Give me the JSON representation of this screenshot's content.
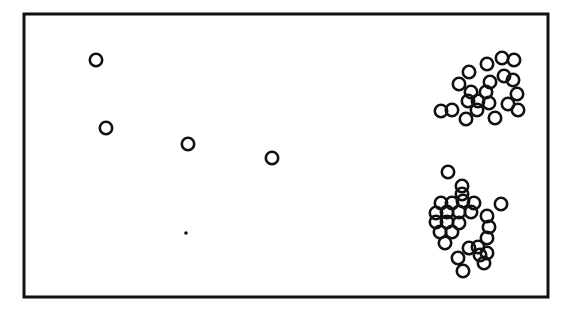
{
  "figure": {
    "width": 563,
    "height": 311,
    "background": "#ffffff",
    "frame": {
      "x": 24,
      "y": 14,
      "width": 524,
      "height": 283,
      "stroke": "#111111",
      "stroke_width": 3,
      "fill": "#ffffff"
    }
  },
  "chart_data": {
    "type": "scatter",
    "title": "",
    "subtitle": "",
    "xlabel": "",
    "ylabel": "",
    "xticklabels": [],
    "yticklabels": [],
    "xlim": [
      24,
      548
    ],
    "ylim": [
      14,
      297
    ],
    "grid": false,
    "legend": null,
    "axes_visible": false,
    "frame_visible": true,
    "marker": {
      "shape": "open-circle",
      "radius": 6.2,
      "stroke": "#111111",
      "stroke_width": 2.6,
      "fill": "none"
    },
    "marker_small": {
      "shape": "filled-dot",
      "radius": 1.8,
      "fill": "#111111"
    },
    "groups": [
      {
        "name": "sparse-left-points",
        "count": 4,
        "points": [
          {
            "x": 96,
            "y": 60
          },
          {
            "x": 106,
            "y": 128
          },
          {
            "x": 188,
            "y": 144
          },
          {
            "x": 272,
            "y": 158
          }
        ]
      },
      {
        "name": "tiny-speck",
        "count": 1,
        "marker": "filled-dot",
        "points": [
          {
            "x": 186,
            "y": 233
          }
        ]
      },
      {
        "name": "upper-right-cluster",
        "count": 21,
        "points": [
          {
            "x": 469,
            "y": 72
          },
          {
            "x": 487,
            "y": 64
          },
          {
            "x": 502,
            "y": 58
          },
          {
            "x": 514,
            "y": 60
          },
          {
            "x": 490,
            "y": 82
          },
          {
            "x": 504,
            "y": 76
          },
          {
            "x": 459,
            "y": 84
          },
          {
            "x": 471,
            "y": 92
          },
          {
            "x": 486,
            "y": 92
          },
          {
            "x": 513,
            "y": 80
          },
          {
            "x": 517,
            "y": 94
          },
          {
            "x": 468,
            "y": 101
          },
          {
            "x": 478,
            "y": 101
          },
          {
            "x": 489,
            "y": 103
          },
          {
            "x": 508,
            "y": 104
          },
          {
            "x": 518,
            "y": 110
          },
          {
            "x": 441,
            "y": 111
          },
          {
            "x": 452,
            "y": 110
          },
          {
            "x": 477,
            "y": 110
          },
          {
            "x": 495,
            "y": 118
          },
          {
            "x": 466,
            "y": 119
          }
        ]
      },
      {
        "name": "lower-right-cluster",
        "count": 28,
        "points": [
          {
            "x": 448,
            "y": 172
          },
          {
            "x": 462,
            "y": 186
          },
          {
            "x": 462,
            "y": 194
          },
          {
            "x": 463,
            "y": 201
          },
          {
            "x": 441,
            "y": 203
          },
          {
            "x": 452,
            "y": 203
          },
          {
            "x": 474,
            "y": 203
          },
          {
            "x": 436,
            "y": 213
          },
          {
            "x": 447,
            "y": 212
          },
          {
            "x": 459,
            "y": 212
          },
          {
            "x": 471,
            "y": 212
          },
          {
            "x": 501,
            "y": 204
          },
          {
            "x": 436,
            "y": 222
          },
          {
            "x": 447,
            "y": 222
          },
          {
            "x": 459,
            "y": 223
          },
          {
            "x": 487,
            "y": 216
          },
          {
            "x": 489,
            "y": 227
          },
          {
            "x": 440,
            "y": 232
          },
          {
            "x": 452,
            "y": 232
          },
          {
            "x": 487,
            "y": 238
          },
          {
            "x": 445,
            "y": 243
          },
          {
            "x": 469,
            "y": 248
          },
          {
            "x": 478,
            "y": 247
          },
          {
            "x": 480,
            "y": 255
          },
          {
            "x": 458,
            "y": 258
          },
          {
            "x": 484,
            "y": 263
          },
          {
            "x": 487,
            "y": 253
          },
          {
            "x": 463,
            "y": 271
          }
        ]
      }
    ]
  }
}
